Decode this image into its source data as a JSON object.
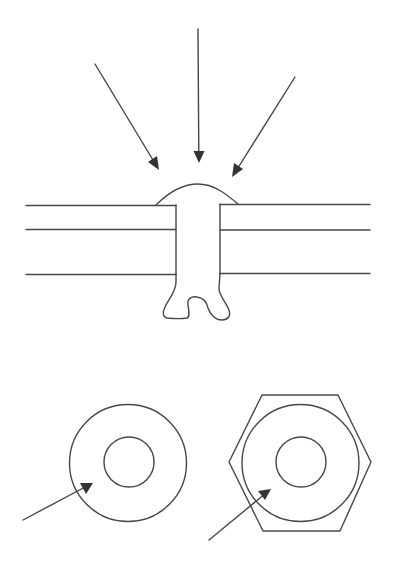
{
  "diagram": {
    "description": "Rivet joint cross-section with compressive force arrows, plus top views of a round washer and a hexagonal nut",
    "colors": {
      "line": "#474747",
      "arrowhead": "#333333",
      "background": "#ffffff"
    },
    "rivet_section": {
      "label": "rivet-cross-section",
      "force_arrows": [
        {
          "name": "left-force-arrow",
          "from": [
            95,
            64
          ],
          "to": [
            159,
            170
          ]
        },
        {
          "name": "center-force-arrow",
          "from": [
            198,
            29
          ],
          "to": [
            199,
            162
          ]
        },
        {
          "name": "right-force-arrow",
          "from": [
            295,
            77
          ],
          "to": [
            232,
            177
          ]
        }
      ],
      "plate_lines_y": [
        205,
        229,
        274
      ],
      "plate_x_range": [
        26,
        370
      ],
      "shank_x": [
        176,
        220
      ],
      "head": {
        "base_left": [
          156,
          205
        ],
        "peak": [
          198,
          184
        ],
        "base_right": [
          238,
          204
        ]
      }
    },
    "top_views": [
      {
        "name": "round-washer",
        "outer_circle": {
          "cx": 128,
          "cy": 463,
          "r": 58
        },
        "inner_circle": {
          "cx": 129,
          "cy": 462,
          "r": 25
        },
        "pointer_arrow": {
          "from": [
            23,
            520
          ],
          "to": [
            93,
            483
          ]
        }
      },
      {
        "name": "hex-nut",
        "hexagon_points": [
          [
            262,
            395
          ],
          [
            338,
            395
          ],
          [
            371,
            462
          ],
          [
            340,
            531
          ],
          [
            263,
            531
          ],
          [
            229,
            462
          ]
        ],
        "outer_circle": {
          "cx": 300,
          "cy": 463,
          "r": 58
        },
        "inner_circle": {
          "cx": 301,
          "cy": 462,
          "r": 25
        },
        "pointer_arrow": {
          "from": [
            209,
            540
          ],
          "to": [
            271,
            489
          ]
        }
      }
    ]
  }
}
